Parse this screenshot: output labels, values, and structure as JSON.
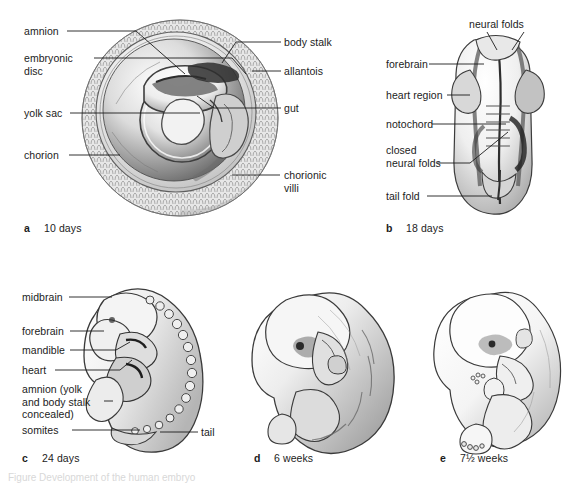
{
  "figure": {
    "background_color": "#ffffff",
    "ink_color": "#1c1c1c",
    "caption_partial": "Figure  Development of the human embryo"
  },
  "panels": [
    {
      "id": "a",
      "letter": "a",
      "title": "10 days",
      "subject": "implanted-blastocyst-chorionic-vesicle",
      "labels": [
        {
          "name": "amnion",
          "text": "amnion"
        },
        {
          "name": "embryonic-disc",
          "text": "embryonic\ndisc"
        },
        {
          "name": "yolk-sac",
          "text": "yolk sac"
        },
        {
          "name": "chorion",
          "text": "chorion"
        },
        {
          "name": "body-stalk",
          "text": "body stalk"
        },
        {
          "name": "allantois",
          "text": "allantois"
        },
        {
          "name": "gut",
          "text": "gut"
        },
        {
          "name": "chorionic-villi",
          "text": "chorionic\nvilli"
        }
      ]
    },
    {
      "id": "b",
      "letter": "b",
      "title": "18 days",
      "subject": "neural-plate-dorsal-view",
      "labels": [
        {
          "name": "neural-folds",
          "text": "neural folds"
        },
        {
          "name": "forebrain",
          "text": "forebrain"
        },
        {
          "name": "heart-region",
          "text": "heart region"
        },
        {
          "name": "notochord",
          "text": "notochord"
        },
        {
          "name": "closed-neural-folds",
          "text": "closed\nneural folds"
        },
        {
          "name": "tail-fold",
          "text": "tail fold"
        }
      ]
    },
    {
      "id": "c",
      "letter": "c",
      "title": "24 days",
      "subject": "c-shaped-embryo-with-somites",
      "labels": [
        {
          "name": "midbrain",
          "text": "midbrain"
        },
        {
          "name": "forebrain",
          "text": "forebrain"
        },
        {
          "name": "mandible",
          "text": "mandible"
        },
        {
          "name": "heart",
          "text": "heart"
        },
        {
          "name": "amnion-note",
          "text": "amnion (yolk\nand body stalk\nconcealed)"
        },
        {
          "name": "somites",
          "text": "somites"
        },
        {
          "name": "tail",
          "text": "tail"
        }
      ]
    },
    {
      "id": "d",
      "letter": "d",
      "title": "6 weeks",
      "subject": "embryo-limb-buds",
      "labels": []
    },
    {
      "id": "e",
      "letter": "e",
      "title": "7½ weeks",
      "subject": "fetus-recognisable-form",
      "labels": []
    }
  ],
  "label_text": {
    "a": {
      "amnion": "amnion",
      "embryonic_disc_l1": "embryonic",
      "embryonic_disc_l2": "disc",
      "yolk_sac": "yolk sac",
      "chorion": "chorion",
      "body_stalk": "body stalk",
      "allantois": "allantois",
      "gut": "gut",
      "chorionic_villi_l1": "chorionic",
      "chorionic_villi_l2": "villi"
    },
    "b": {
      "neural_folds": "neural folds",
      "forebrain": "forebrain",
      "heart_region": "heart region",
      "notochord": "notochord",
      "closed_l1": "closed",
      "closed_l2": "neural folds",
      "tail_fold": "tail fold"
    },
    "c": {
      "midbrain": "midbrain",
      "forebrain": "forebrain",
      "mandible": "mandible",
      "heart": "heart",
      "amnion_l1": "amnion (yolk",
      "amnion_l2": "and body stalk",
      "amnion_l3": "concealed)",
      "somites": "somites",
      "tail": "tail"
    }
  },
  "captions": {
    "a_letter": "a",
    "a_text": "10 days",
    "b_letter": "b",
    "b_text": "18 days",
    "c_letter": "c",
    "c_text": "24 days",
    "d_letter": "d",
    "d_text": "6 weeks",
    "e_letter": "e",
    "e_text": "7½ weeks"
  }
}
